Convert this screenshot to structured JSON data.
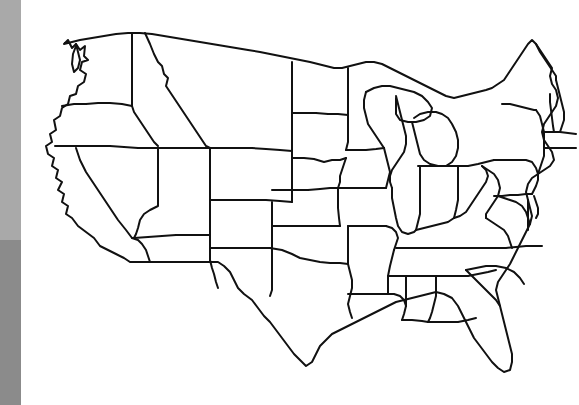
{
  "page": {
    "background_color": "#ffffff",
    "width": 579,
    "height": 405
  },
  "side_bar": {
    "name": "left-vertical-gray-bar",
    "width": 21,
    "bands": [
      {
        "label": "upper-light-gray-band",
        "color": "#a9a9a9",
        "top": 0,
        "height": 240
      },
      {
        "label": "lower-dark-gray-band",
        "color": "#8b8b8b",
        "top": 240,
        "height": 165
      }
    ]
  },
  "map": {
    "name": "united-states-contiguous-outline",
    "projection_note": "contiguous 48 states, state borders only, no labels",
    "line_color": "#111111",
    "fill_color": "#ffffff",
    "stroke_width": 2,
    "bounds": {
      "left": 22,
      "top": 25,
      "right": 579,
      "bottom": 390
    },
    "states_depicted": [
      "Washington",
      "Oregon",
      "California",
      "Nevada",
      "Idaho",
      "Montana",
      "Wyoming",
      "Utah",
      "Arizona",
      "Colorado",
      "New Mexico",
      "North Dakota",
      "South Dakota",
      "Nebraska",
      "Kansas",
      "Oklahoma",
      "Texas",
      "Minnesota",
      "Iowa",
      "Missouri",
      "Arkansas",
      "Louisiana",
      "Wisconsin",
      "Illinois",
      "Michigan",
      "Indiana",
      "Ohio",
      "Kentucky",
      "Tennessee",
      "Mississippi",
      "Alabama",
      "Georgia",
      "Florida",
      "South Carolina",
      "North Carolina",
      "Virginia",
      "West Virginia",
      "Maryland",
      "Delaware",
      "Pennsylvania",
      "New Jersey",
      "New York",
      "Connecticut",
      "Rhode Island",
      "Massachusetts",
      "Vermont",
      "New Hampshire",
      "Maine"
    ],
    "state_count": 48,
    "labels_visible": "none"
  }
}
